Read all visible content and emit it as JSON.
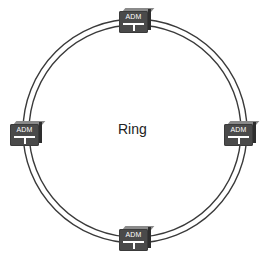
{
  "diagram": {
    "center_label": "Ring",
    "ring": {
      "cx": 135,
      "cy": 131,
      "outer_radius": 112,
      "inner_radius": 106,
      "stroke_color": "#3a3a3a"
    },
    "nodes": [
      {
        "id": "top",
        "label": "ADM",
        "x": 119,
        "y": 8
      },
      {
        "id": "left",
        "label": "ADM",
        "x": 10,
        "y": 121
      },
      {
        "id": "right",
        "label": "ADM",
        "x": 224,
        "y": 121
      },
      {
        "id": "bottom",
        "label": "ADM",
        "x": 119,
        "y": 226
      }
    ],
    "colors": {
      "node_body": "#4a4a4a",
      "node_top": "#8a8a8a",
      "node_side": "#2e2e2e",
      "node_text": "#ffffff"
    }
  }
}
